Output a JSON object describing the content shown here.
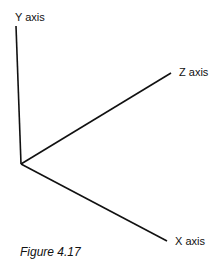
{
  "diagram": {
    "axes": [
      {
        "name": "y",
        "label": "Y axis",
        "from": [
          21,
          164
        ],
        "to": [
          16,
          26
        ]
      },
      {
        "name": "z",
        "label": "Z axis",
        "from": [
          21,
          164
        ],
        "to": [
          171,
          73
        ]
      },
      {
        "name": "x",
        "label": "X axis",
        "from": [
          21,
          164
        ],
        "to": [
          167,
          241
        ]
      }
    ],
    "caption": "Figure 4.17",
    "line_color": "#111111"
  }
}
